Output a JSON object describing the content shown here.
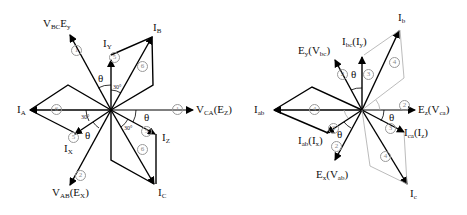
{
  "left_diagram": {
    "labels": {
      "vbc": {
        "main": "V",
        "sub1": "BC",
        "mid": "E",
        "sub2": "y"
      },
      "iy": {
        "main": "I",
        "sub": "Y"
      },
      "ib": {
        "main": "I",
        "sub": "B"
      },
      "ia": {
        "main": "I",
        "sub": "A"
      },
      "vca": {
        "main": "V",
        "sub1": "CA",
        "mid": "(E",
        "sub2": "Z",
        "end": ")"
      },
      "ix": {
        "main": "I",
        "sub": "X"
      },
      "iz": {
        "main": "I",
        "sub": "Z"
      },
      "vab": {
        "main": "V",
        "sub1": "AB",
        "mid": "(E",
        "sub2": "X",
        "end": ")"
      },
      "ic": {
        "main": "I",
        "sub": "C"
      }
    },
    "angles": {
      "theta": "θ",
      "thirty": "30°"
    },
    "circled": [
      "1",
      "5",
      "6",
      "6",
      "1",
      "5",
      "5",
      "6",
      "2"
    ]
  },
  "right_diagram": {
    "labels": {
      "ib": {
        "main": "I",
        "sub": "b"
      },
      "ey": {
        "main": "E",
        "sub1": "y",
        "mid": "(V",
        "sub2": "bc",
        "end": ")"
      },
      "ibc": {
        "main": "I",
        "sub1": "bc",
        "mid": "(I",
        "sub2": "y",
        "end": ")"
      },
      "iab_left": {
        "main": "I",
        "sub": "ab"
      },
      "ez": {
        "main": "E",
        "sub1": "z",
        "mid": "(V",
        "sub2": "ca",
        "end": ")"
      },
      "iab_ix": {
        "main": "I",
        "sub1": "ab",
        "mid": "(I",
        "sub2": "x",
        "end": ")"
      },
      "ica": {
        "main": "I",
        "sub1": "ca",
        "mid": "(I",
        "sub2": "z",
        "end": ")"
      },
      "ex": {
        "main": "E",
        "sub1": "x",
        "mid": "(V",
        "sub2": "ab",
        "end": ")"
      },
      "ic": {
        "main": "I",
        "sub": "c"
      }
    },
    "angles": {
      "theta": "θ"
    },
    "circled": [
      "4",
      "2",
      "3",
      "4",
      "2",
      "3",
      "2",
      "3",
      "4"
    ]
  }
}
